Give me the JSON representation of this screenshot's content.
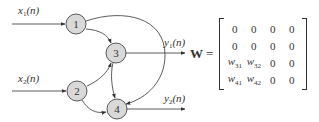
{
  "diagram": {
    "inputs": [
      {
        "label": "x",
        "sub": "1",
        "arg": "(n)"
      },
      {
        "label": "x",
        "sub": "2",
        "arg": "(n)"
      }
    ],
    "outputs": [
      {
        "label": "y",
        "sub": "1",
        "arg": "(n)"
      },
      {
        "label": "y",
        "sub": "2",
        "arg": "(n)"
      }
    ],
    "nodes": [
      {
        "id": "1",
        "label": "1"
      },
      {
        "id": "2",
        "label": "2"
      },
      {
        "id": "3",
        "label": "3"
      },
      {
        "id": "4",
        "label": "4"
      }
    ],
    "edges": [
      {
        "from": "x1",
        "to": "1"
      },
      {
        "from": "x2",
        "to": "2"
      },
      {
        "from": "1",
        "to": "3"
      },
      {
        "from": "1",
        "to": "4"
      },
      {
        "from": "2",
        "to": "3"
      },
      {
        "from": "2",
        "to": "4"
      },
      {
        "from": "3",
        "to": "4"
      },
      {
        "from": "3",
        "to": "y1"
      },
      {
        "from": "4",
        "to": "y2"
      }
    ],
    "node_fill": "#d9d9d9",
    "stroke": "#333333"
  },
  "matrix": {
    "name": "W",
    "equals": "=",
    "rows": [
      [
        "0",
        "0",
        "0",
        "0"
      ],
      [
        "0",
        "0",
        "0",
        "0"
      ],
      [
        {
          "w": "w",
          "sub": "31"
        },
        {
          "w": "w",
          "sub": "32"
        },
        "0",
        "0"
      ],
      [
        {
          "w": "w",
          "sub": "41"
        },
        {
          "w": "w",
          "sub": "42"
        },
        "0",
        "0"
      ]
    ]
  }
}
